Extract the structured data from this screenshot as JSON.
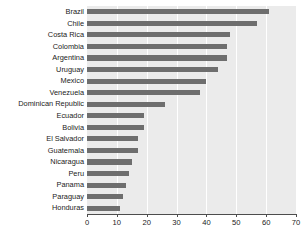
{
  "chart_data": {
    "type": "bar",
    "orientation": "horizontal",
    "title": "",
    "xlabel": "",
    "ylabel": "",
    "xlim": [
      0,
      70
    ],
    "xticks": [
      0,
      10,
      20,
      30,
      40,
      50,
      60,
      70
    ],
    "grid": true,
    "grid_axis": "x",
    "legend": null,
    "categories": [
      "Brazil",
      "Chile",
      "Costa Rica",
      "Colombia",
      "Argentina",
      "Uruguay",
      "Mexico",
      "Venezuela",
      "Dominican Republic",
      "Ecuador",
      "Bolivia",
      "El Salvador",
      "Guatemala",
      "Nicaragua",
      "Peru",
      "Panama",
      "Paraguay",
      "Honduras"
    ],
    "values": [
      61,
      57,
      48,
      47,
      47,
      44,
      40,
      38,
      26,
      19,
      19,
      17,
      17,
      15,
      14,
      13,
      12,
      11
    ]
  },
  "style": {
    "bar_color": "#6e6e6e",
    "panel_background": "#ebebeb",
    "gridline_color": "#ffffff",
    "axis_color": "#4d4d4d",
    "text_color": "#222222",
    "figure_background": "#ffffff"
  }
}
